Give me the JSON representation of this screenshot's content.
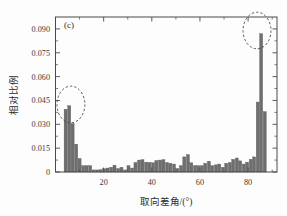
{
  "figure": {
    "panel_label": "(c)",
    "background_color": "#fdfdfd",
    "frame_color": "#4a4a4a"
  },
  "chart_data": {
    "type": "bar",
    "title": "",
    "subtitle": "",
    "panel_label": "(c)",
    "xlabel": "取向差角/(°)",
    "ylabel": "相对比例",
    "xlim": [
      0,
      92
    ],
    "ylim": [
      0,
      0.0975
    ],
    "grid": false,
    "legend": null,
    "bar_color": "#6e6e6e",
    "bar_edge_color": "#5c5c5c",
    "xticks": [
      20,
      40,
      60,
      80
    ],
    "xticklabels": [
      "20",
      "40",
      "60",
      "80"
    ],
    "yticks": [
      0,
      0.015,
      0.03,
      0.045,
      0.06,
      0.075,
      0.09
    ],
    "yticklabels": [
      "0",
      "0.015",
      "0.030",
      "0.045",
      "0.060",
      "0.075",
      "0.090"
    ],
    "bin_width": 1.45,
    "x": [
      4.3,
      5.8,
      7.2,
      8.7,
      10.1,
      11.6,
      13.0,
      14.5,
      15.9,
      17.4,
      18.8,
      20.3,
      21.7,
      23.2,
      24.6,
      26.1,
      27.5,
      29.0,
      30.4,
      31.9,
      33.3,
      34.8,
      36.2,
      37.7,
      39.1,
      40.6,
      42.0,
      43.5,
      44.9,
      46.4,
      47.8,
      49.3,
      50.7,
      52.2,
      53.6,
      55.1,
      56.5,
      58.0,
      59.4,
      60.9,
      62.3,
      63.8,
      65.2,
      66.7,
      68.1,
      69.6,
      71.0,
      72.5,
      73.9,
      75.4,
      76.8,
      78.3,
      79.7,
      81.2,
      82.6,
      84.1,
      85.5,
      87.0,
      88.4
    ],
    "values": [
      0.0395,
      0.0417,
      0.0305,
      0.0175,
      0.0085,
      0.004,
      0.004,
      0.004,
      0.0013,
      0.0013,
      0.0015,
      0.002,
      0.0025,
      0.003,
      0.0043,
      0.0022,
      0.003,
      0.0013,
      0.004,
      0.0025,
      0.006,
      0.0075,
      0.0078,
      0.0062,
      0.006,
      0.0058,
      0.0072,
      0.0075,
      0.0078,
      0.006,
      0.0055,
      0.005,
      0.0022,
      0.004,
      0.0095,
      0.011,
      0.0058,
      0.004,
      0.004,
      0.004,
      0.0055,
      0.0068,
      0.004,
      0.0045,
      0.005,
      0.003,
      0.0055,
      0.006,
      0.008,
      0.0088,
      0.007,
      0.005,
      0.0062,
      0.008,
      0.0095,
      0.044,
      0.087,
      0.038,
      0.0
    ],
    "annotations": [
      {
        "name": "left-peak-highlight",
        "shape": "dashed-circle",
        "center_x": 6.4,
        "center_y": 0.0425,
        "radius_x": 5.8,
        "radius_y": 0.0115
      },
      {
        "name": "right-peak-highlight",
        "shape": "dashed-circle",
        "center_x": 83.7,
        "center_y": 0.089,
        "radius_x": 5.8,
        "radius_y": 0.0115
      }
    ]
  }
}
